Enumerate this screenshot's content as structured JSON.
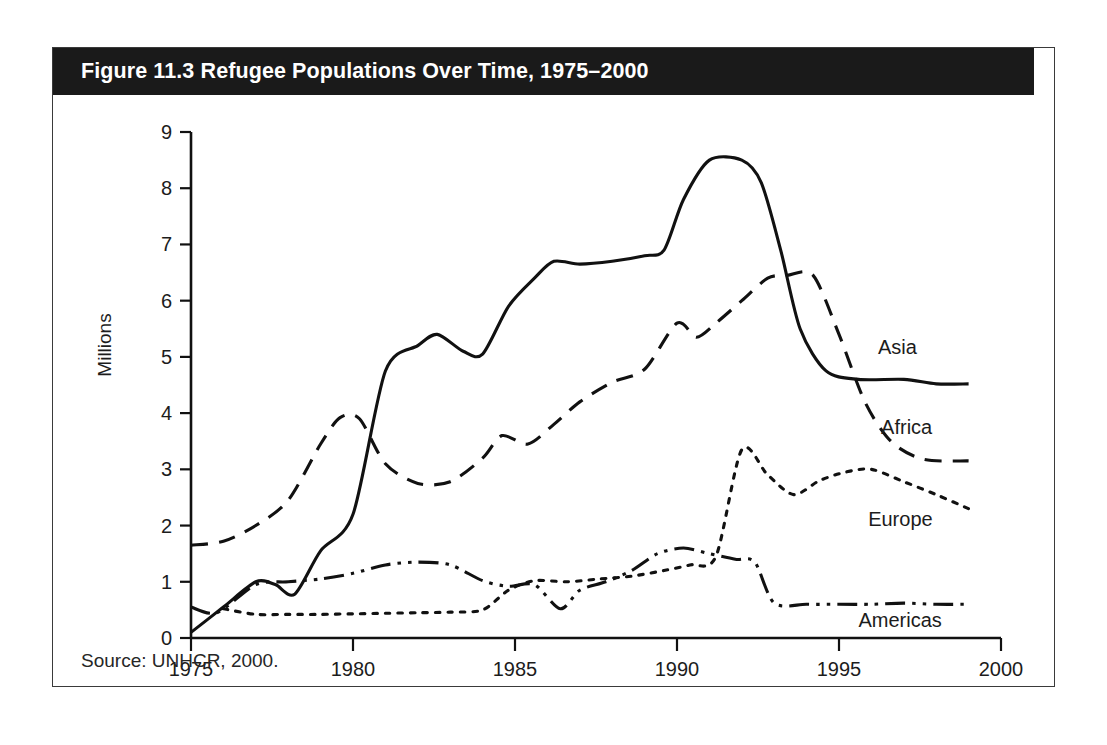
{
  "figure": {
    "title": "Figure 11.3 Refugee Populations Over Time, 1975–2000",
    "source": "Source: UNHCR, 2000.",
    "header_bg": "#1a1a1a",
    "header_fg": "#ffffff",
    "frame_color": "#3a3a3a"
  },
  "chart_data": {
    "type": "line",
    "title": "Figure 11.3 Refugee Populations Over Time, 1975–2000",
    "subtitle": "",
    "xlabel": "",
    "ylabel": "Millions",
    "xlim": [
      1975,
      2000
    ],
    "ylim": [
      0,
      9
    ],
    "xticks": [
      1975,
      1980,
      1985,
      1990,
      1995,
      2000
    ],
    "xtick_labels": [
      "1975",
      "1980",
      "1985",
      "1990",
      "1995",
      "2000"
    ],
    "yticks": [
      0,
      1,
      2,
      3,
      4,
      5,
      6,
      7,
      8,
      9
    ],
    "ytick_labels": [
      "0",
      "1",
      "2",
      "3",
      "4",
      "5",
      "6",
      "7",
      "8",
      "9"
    ],
    "grid": false,
    "legend_position": "inline-right-of-line-ends",
    "units": "millions of refugees",
    "line_color": "#111111",
    "series": [
      {
        "name": "Asia",
        "style": "solid",
        "label_x": 1996.2,
        "label_y": 5.05,
        "x": [
          1975,
          1976,
          1977,
          1977.6,
          1978.2,
          1979,
          1980,
          1981,
          1982,
          1982.6,
          1983.4,
          1984,
          1984.8,
          1985.6,
          1986.2,
          1987,
          1988,
          1989,
          1989.6,
          1990.2,
          1991,
          1992,
          1992.6,
          1993.2,
          1993.8,
          1994.6,
          1995.6,
          1997,
          1998,
          1999
        ],
        "y": [
          0.1,
          0.55,
          1.0,
          0.95,
          0.78,
          1.55,
          2.2,
          4.75,
          5.2,
          5.4,
          5.1,
          5.05,
          5.9,
          6.4,
          6.7,
          6.65,
          6.7,
          6.8,
          6.9,
          7.8,
          8.5,
          8.5,
          8.1,
          6.9,
          5.5,
          4.75,
          4.6,
          4.6,
          4.52,
          4.52
        ]
      },
      {
        "name": "Africa",
        "style": "dashed",
        "label_x": 1996.3,
        "label_y": 3.62,
        "x": [
          1975,
          1976,
          1977,
          1978,
          1979,
          1979.6,
          1980.2,
          1981,
          1982,
          1983,
          1984,
          1984.6,
          1985.4,
          1986.2,
          1987,
          1988,
          1989,
          1990,
          1990.6,
          1991.2,
          1992,
          1992.8,
          1993.4,
          1994.2,
          1995,
          1995.8,
          1996.6,
          1997.6,
          1999
        ],
        "y": [
          1.65,
          1.72,
          2.0,
          2.45,
          3.45,
          3.92,
          3.9,
          3.1,
          2.75,
          2.78,
          3.2,
          3.6,
          3.45,
          3.8,
          4.2,
          4.55,
          4.78,
          5.6,
          5.35,
          5.6,
          6.0,
          6.4,
          6.45,
          6.45,
          5.4,
          4.2,
          3.5,
          3.18,
          3.15
        ]
      },
      {
        "name": "Europe",
        "style": "dotted",
        "label_x": 1995.9,
        "label_y": 2.0,
        "x": [
          1976,
          1977,
          1978,
          1979,
          1980,
          1981,
          1982,
          1983,
          1984,
          1984.8,
          1985.6,
          1986.6,
          1987.6,
          1988.6,
          1989.6,
          1990.4,
          1991.2,
          1992,
          1992.8,
          1993.6,
          1994.4,
          1995.2,
          1996,
          1997,
          1998,
          1999
        ],
        "y": [
          0.52,
          0.42,
          0.42,
          0.42,
          0.43,
          0.44,
          0.45,
          0.46,
          0.5,
          0.85,
          1.02,
          1.0,
          1.05,
          1.1,
          1.2,
          1.3,
          1.45,
          3.35,
          2.9,
          2.55,
          2.8,
          2.95,
          3.0,
          2.78,
          2.55,
          2.3
        ]
      },
      {
        "name": "Americas",
        "style": "dashdot",
        "label_x": 1995.6,
        "label_y": 0.2,
        "x": [
          1975,
          1975.8,
          1977,
          1978,
          1979,
          1980,
          1981,
          1982,
          1983,
          1984,
          1984.8,
          1985.6,
          1986.4,
          1987,
          1987.8,
          1988.6,
          1989.4,
          1990.2,
          1991,
          1991.8,
          1992.4,
          1993,
          1994,
          1995,
          1996,
          1997,
          1998,
          1999
        ],
        "y": [
          0.55,
          0.45,
          0.95,
          1.0,
          1.05,
          1.15,
          1.3,
          1.35,
          1.3,
          1.02,
          0.92,
          0.95,
          0.52,
          0.85,
          1.0,
          1.2,
          1.5,
          1.6,
          1.5,
          1.4,
          1.35,
          0.62,
          0.6,
          0.6,
          0.6,
          0.62,
          0.6,
          0.6
        ]
      }
    ]
  }
}
